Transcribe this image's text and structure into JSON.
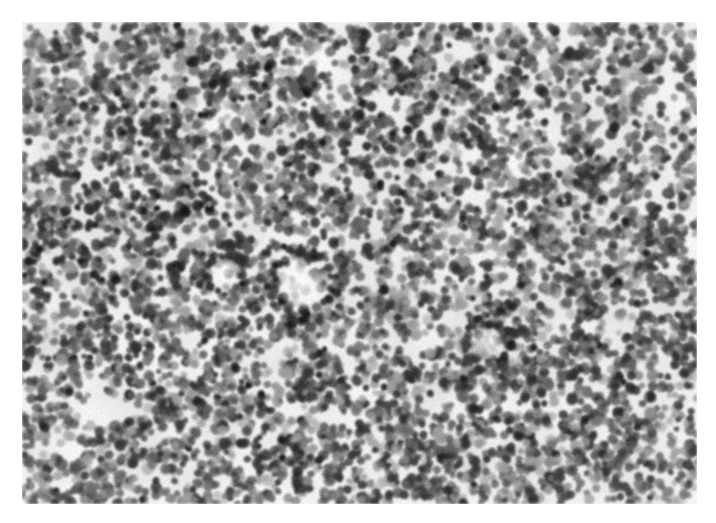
{
  "page": {
    "background_color": "#ffffff",
    "width": 716,
    "height": 523,
    "type": "photomicrograph",
    "has_text_labels": false,
    "has_scale_bar": false,
    "has_border_line": false
  },
  "image": {
    "name": "histopathology-micrograph",
    "alt_text": "High power photomicrograph of densely cellular lymphoid tissue showing sheets of small round dark nuclei on a pale background",
    "modality": "light-microscopy",
    "stain": "hematoxylin-and-eosin-grayscale",
    "color_mode": "grayscale",
    "magnification_appearance": "high-power",
    "tissue_description": "diffuse sheets of small to medium sized round lymphoid cells with scant cytoplasm, scattered pale clearings and a small central vascular ring",
    "frame": {
      "left": 22,
      "top": 22,
      "width": 675,
      "height": 482
    },
    "tones": {
      "background": "#fbfbfa",
      "cytoplasm_pale": "#f0f0ee",
      "nucleus_light": "#9a9a98",
      "nucleus_mid": "#5e5e5c",
      "nucleus_dark": "#2a2a29",
      "nucleus_darkest": "#121212",
      "stroma_gray": "#c9c9c7",
      "clearing_white": "#ffffff"
    },
    "render": {
      "seed": 20240917,
      "nuclei_count": 5200,
      "nucleus_radius_min": 3.2,
      "nucleus_radius_max": 6.6,
      "blur_px": 0.9,
      "grain_strength": 14,
      "pale_clearings": [
        {
          "cx": 0.115,
          "cy": 0.815,
          "rx": 0.075,
          "ry": 0.055,
          "strength": 0.92
        },
        {
          "cx": 0.062,
          "cy": 0.885,
          "rx": 0.045,
          "ry": 0.04,
          "strength": 0.85
        },
        {
          "cx": 0.455,
          "cy": 0.075,
          "rx": 0.06,
          "ry": 0.042,
          "strength": 0.62
        },
        {
          "cx": 0.645,
          "cy": 0.06,
          "rx": 0.048,
          "ry": 0.034,
          "strength": 0.55
        },
        {
          "cx": 0.3,
          "cy": 0.33,
          "rx": 0.052,
          "ry": 0.038,
          "strength": 0.48
        },
        {
          "cx": 0.405,
          "cy": 0.52,
          "rx": 0.04,
          "ry": 0.032,
          "strength": 0.5
        },
        {
          "cx": 0.76,
          "cy": 0.28,
          "rx": 0.055,
          "ry": 0.04,
          "strength": 0.45
        },
        {
          "cx": 0.87,
          "cy": 0.64,
          "rx": 0.046,
          "ry": 0.036,
          "strength": 0.44
        },
        {
          "cx": 0.56,
          "cy": 0.76,
          "rx": 0.042,
          "ry": 0.03,
          "strength": 0.4
        },
        {
          "cx": 0.2,
          "cy": 0.12,
          "rx": 0.05,
          "ry": 0.036,
          "strength": 0.42
        },
        {
          "cx": 0.93,
          "cy": 0.15,
          "rx": 0.042,
          "ry": 0.034,
          "strength": 0.4
        },
        {
          "cx": 0.715,
          "cy": 0.93,
          "rx": 0.04,
          "ry": 0.03,
          "strength": 0.38
        }
      ],
      "dense_patches": [
        {
          "cx": 0.25,
          "cy": 0.47,
          "rx": 0.135,
          "ry": 0.12,
          "strength": 0.34
        },
        {
          "cx": 0.82,
          "cy": 0.88,
          "rx": 0.12,
          "ry": 0.1,
          "strength": 0.3
        },
        {
          "cx": 0.085,
          "cy": 0.38,
          "rx": 0.09,
          "ry": 0.13,
          "strength": 0.28
        },
        {
          "cx": 0.53,
          "cy": 0.2,
          "rx": 0.1,
          "ry": 0.09,
          "strength": 0.22
        },
        {
          "cx": 0.38,
          "cy": 0.88,
          "rx": 0.11,
          "ry": 0.085,
          "strength": 0.26
        },
        {
          "cx": 0.95,
          "cy": 0.45,
          "rx": 0.08,
          "ry": 0.12,
          "strength": 0.2
        }
      ],
      "vessel_rings": [
        {
          "cx": 0.415,
          "cy": 0.545,
          "r": 0.036,
          "thickness": 0.013
        },
        {
          "cx": 0.688,
          "cy": 0.668,
          "r": 0.026,
          "thickness": 0.01
        },
        {
          "cx": 0.3,
          "cy": 0.52,
          "r": 0.022,
          "thickness": 0.009
        }
      ],
      "sparse_regions": [
        {
          "cx": 0.88,
          "cy": 0.12,
          "rx": 0.11,
          "ry": 0.12,
          "strength": 0.3
        },
        {
          "cx": 0.14,
          "cy": 0.72,
          "rx": 0.1,
          "ry": 0.11,
          "strength": 0.34
        }
      ]
    }
  }
}
